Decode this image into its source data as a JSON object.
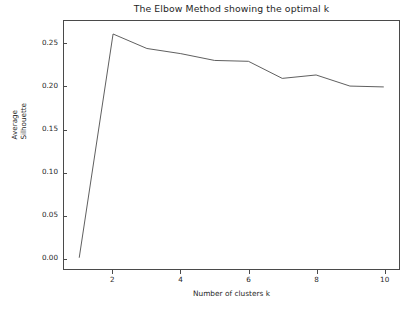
{
  "chart_data": {
    "type": "line",
    "title": "The Elbow Method showing the optimal k",
    "xlabel": "Number of clusters k",
    "ylabel": "Average Silhouette",
    "ylabel_lines": [
      "Average",
      "Silhouette"
    ],
    "x": [
      1,
      2,
      3,
      4,
      5,
      6,
      7,
      8,
      9,
      10
    ],
    "values": [
      0.0,
      0.262,
      0.245,
      0.239,
      0.231,
      0.23,
      0.21,
      0.214,
      0.201,
      0.2
    ],
    "series": [
      {
        "name": "Average Silhouette",
        "values": [
          0.0,
          0.262,
          0.245,
          0.239,
          0.231,
          0.23,
          0.21,
          0.214,
          0.201,
          0.2
        ]
      }
    ],
    "xlim": [
      0.55,
      10.45
    ],
    "ylim": [
      -0.0132,
      0.2772
    ],
    "xticks": [
      2,
      4,
      6,
      8,
      10
    ],
    "xtick_labels": [
      "2",
      "4",
      "6",
      "8",
      "10"
    ],
    "yticks": [
      0.0,
      0.05,
      0.1,
      0.15,
      0.2,
      0.25
    ],
    "ytick_labels": [
      "0.00",
      "0.05",
      "0.10",
      "0.15",
      "0.20",
      "0.25"
    ],
    "grid": false,
    "legend": false,
    "legend_position": "none",
    "line_color": "#4d4d4d",
    "line_width": 0.9,
    "marker": "none",
    "background_color": "#ffffff",
    "axes_color": "#4a4a4a"
  }
}
